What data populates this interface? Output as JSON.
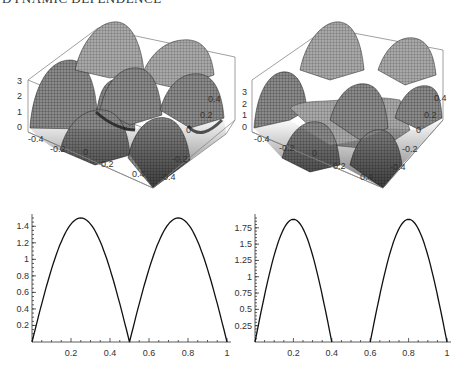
{
  "page": {
    "header": "DYNAMIC DEPENDENCE"
  },
  "chart_data": [
    {
      "type": "surface3d",
      "title": "",
      "position": "top-left",
      "z_ticks": [
        "0",
        "1",
        "2",
        "3"
      ],
      "x_ticks": [
        "-0.4",
        "-0.2",
        "0",
        "0.2",
        "0.4"
      ],
      "y_ticks": [
        "-0.4",
        "-0.2",
        "0",
        "0.2",
        "0.4"
      ],
      "zlim": [
        0,
        3
      ],
      "xlim": [
        -0.5,
        0.5
      ],
      "ylim": [
        -0.5,
        0.5
      ],
      "description": "Periodic surface of arched humps (2x2 grid of peaks near z=3), gray mesh shading"
    },
    {
      "type": "surface3d",
      "title": "",
      "position": "top-right",
      "z_ticks": [
        "0",
        "1",
        "2",
        "3"
      ],
      "x_ticks": [
        "-0.4",
        "-0.2",
        "0",
        "0.2",
        "0.4"
      ],
      "y_ticks": [
        "-0.4",
        "-0.2",
        "0",
        "0.2",
        "0.4"
      ],
      "zlim": [
        0,
        3.5
      ],
      "xlim": [
        -0.5,
        0.5
      ],
      "ylim": [
        -0.5,
        0.5
      ],
      "description": "Periodic surface with narrower humps separated by flat regions, gray mesh shading"
    },
    {
      "type": "line",
      "title": "",
      "position": "bottom-left",
      "xlabel": "",
      "ylabel": "",
      "x_ticks": [
        "0.2",
        "0.4",
        "0.6",
        "0.8",
        "1"
      ],
      "y_ticks": [
        "0.2",
        "0.4",
        "0.6",
        "0.8",
        "1",
        "1.2",
        "1.4"
      ],
      "xlim": [
        0,
        1
      ],
      "ylim": [
        0,
        1.5
      ],
      "grid": false,
      "series": [
        {
          "name": "profile",
          "x": [
            0,
            0.05,
            0.1,
            0.15,
            0.2,
            0.25,
            0.3,
            0.35,
            0.4,
            0.45,
            0.5,
            0.55,
            0.6,
            0.65,
            0.7,
            0.75,
            0.8,
            0.85,
            0.9,
            0.95,
            1
          ],
          "values": [
            0,
            0.57,
            0.96,
            1.26,
            1.44,
            1.5,
            1.44,
            1.26,
            0.96,
            0.57,
            0,
            0.57,
            0.96,
            1.26,
            1.44,
            1.5,
            1.44,
            1.26,
            0.96,
            0.57,
            0
          ]
        }
      ],
      "peaks": [
        {
          "x": 0.25,
          "y": 1.5
        },
        {
          "x": 0.75,
          "y": 1.5
        }
      ],
      "zeros": [
        0,
        0.5,
        1
      ]
    },
    {
      "type": "line",
      "title": "",
      "position": "bottom-right",
      "xlabel": "",
      "ylabel": "",
      "x_ticks": [
        "0.2",
        "0.4",
        "0.6",
        "0.8",
        "1"
      ],
      "y_ticks": [
        "0.25",
        "0.5",
        "0.75",
        "1",
        "1.25",
        "1.5",
        "1.75"
      ],
      "xlim": [
        0,
        1
      ],
      "ylim": [
        0,
        1.9
      ],
      "grid": false,
      "series": [
        {
          "name": "profile",
          "x": [
            0,
            0.05,
            0.1,
            0.15,
            0.2,
            0.25,
            0.3,
            0.35,
            0.4,
            0.6,
            0.65,
            0.7,
            0.75,
            0.8,
            0.85,
            0.9,
            0.95,
            1
          ],
          "values": [
            0,
            0.82,
            1.41,
            1.76,
            1.88,
            1.76,
            1.41,
            0.82,
            0,
            0,
            0.82,
            1.41,
            1.76,
            1.88,
            1.76,
            1.41,
            0.82,
            0
          ]
        }
      ],
      "peaks": [
        {
          "x": 0.2,
          "y": 1.88
        },
        {
          "x": 0.8,
          "y": 1.88
        }
      ],
      "zeros": [
        0,
        0.4,
        0.6,
        1
      ]
    }
  ]
}
